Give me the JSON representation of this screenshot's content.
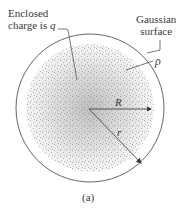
{
  "figure": {
    "labels": {
      "enclosed_line1": "Enclosed",
      "enclosed_line2": "charge is",
      "q": "q",
      "gaussian_line1": "Gaussian",
      "gaussian_line2": "surface",
      "rho": "ρ",
      "R": "R",
      "r": "r",
      "caption": "(a)"
    },
    "colors": {
      "outline": "#666666",
      "dots": "#8a8a8a",
      "text": "#3a3a3a"
    }
  }
}
